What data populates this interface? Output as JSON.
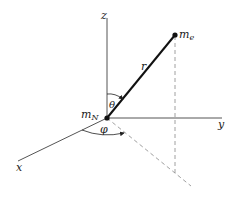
{
  "diagram": {
    "colors": {
      "axis": "#555555",
      "vector": "#111111",
      "dashed": "#888888",
      "text": "#222222",
      "background": "#ffffff"
    },
    "axes": {
      "x": {
        "label": "x"
      },
      "y": {
        "label": "y"
      },
      "z": {
        "label": "z"
      }
    },
    "points": {
      "nucleus": {
        "label": "m",
        "subscript": "N"
      },
      "electron": {
        "label": "m",
        "subscript": "e"
      }
    },
    "vector": {
      "label": "r"
    },
    "angles": {
      "polar": {
        "label": "θ"
      },
      "azimuthal": {
        "label": "φ"
      }
    }
  }
}
